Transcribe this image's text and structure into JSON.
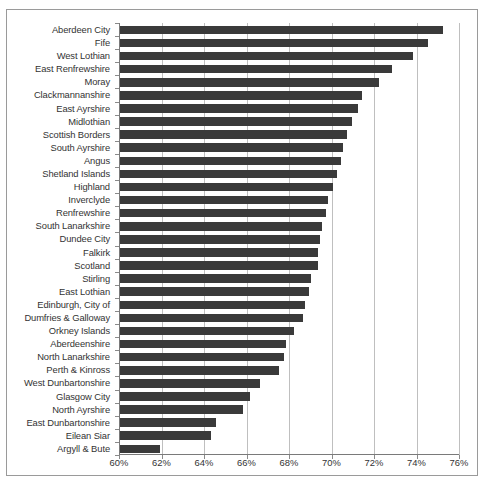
{
  "chart_data": {
    "type": "bar",
    "orientation": "horizontal",
    "title": "",
    "subtitle": "",
    "xlabel": "",
    "ylabel": "",
    "xlim": [
      60,
      76
    ],
    "xtick_step": 2,
    "xtick_labels": [
      "60%",
      "62%",
      "64%",
      "66%",
      "68%",
      "70%",
      "72%",
      "74%",
      "76%"
    ],
    "xtick_values": [
      60,
      62,
      64,
      66,
      68,
      70,
      72,
      74,
      76
    ],
    "grid": "vertical",
    "legend": "none",
    "bar_color": "#3a3a3a",
    "categories": [
      "Aberdeen City",
      "Fife",
      "West Lothian",
      "East Renfrewshire",
      "Moray",
      "Clackmannanshire",
      "East Ayrshire",
      "Midlothian",
      "Scottish Borders",
      "South Ayrshire",
      "Angus",
      "Shetland Islands",
      "Highland",
      "Inverclyde",
      "Renfrewshire",
      "South Lanarkshire",
      "Dundee City",
      "Falkirk",
      "Scotland",
      "Stirling",
      "East Lothian",
      "Edinburgh, City of",
      "Dumfries & Galloway",
      "Orkney Islands",
      "Aberdeenshire",
      "North Lanarkshire",
      "Perth & Kinross",
      "West Dunbartonshire",
      "Glasgow City",
      "North Ayrshire",
      "East Dunbartonshire",
      "Eilean Siar",
      "Argyll & Bute"
    ],
    "values": [
      75.2,
      74.5,
      73.8,
      72.8,
      72.2,
      71.4,
      71.2,
      70.9,
      70.7,
      70.5,
      70.4,
      70.2,
      70.0,
      69.8,
      69.7,
      69.5,
      69.4,
      69.3,
      69.3,
      69.0,
      68.9,
      68.7,
      68.6,
      68.2,
      67.8,
      67.7,
      67.5,
      66.6,
      66.1,
      65.8,
      64.5,
      64.3,
      61.9
    ]
  }
}
